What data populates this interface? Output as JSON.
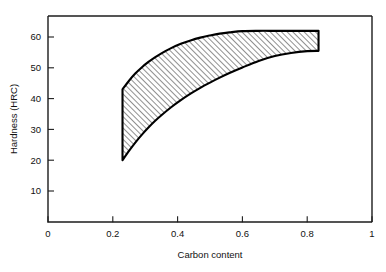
{
  "chart_data": {
    "type": "area",
    "title": "",
    "subtitle": "",
    "xlabel": "Carbon content",
    "ylabel": "Hardness (HRC)",
    "xlim": [
      0,
      1
    ],
    "ylim": [
      0,
      67
    ],
    "grid": false,
    "legend": null,
    "x_ticks": [
      "0",
      "0.2",
      "0.4",
      "0.6",
      "0.8",
      "1"
    ],
    "x_tick_values": [
      0,
      0.2,
      0.4,
      0.6,
      0.8,
      1
    ],
    "y_ticks": [
      "10",
      "20",
      "30",
      "40",
      "50",
      "60"
    ],
    "y_tick_values": [
      10,
      20,
      30,
      40,
      50,
      60
    ],
    "band": {
      "name": "Hardness range of fully hardened steel",
      "fill": "diagonal-hatch",
      "x": [
        0.23,
        0.25,
        0.27,
        0.29,
        0.31,
        0.33,
        0.35,
        0.38,
        0.41,
        0.44,
        0.47,
        0.5,
        0.53,
        0.56,
        0.6,
        0.65,
        0.7,
        0.75,
        0.8,
        0.835
      ],
      "upper": [
        43.0,
        45.8,
        48.2,
        50.2,
        51.9,
        53.4,
        54.7,
        56.4,
        57.8,
        58.9,
        59.8,
        60.5,
        61.1,
        61.5,
        61.9,
        62.0,
        62.0,
        62.0,
        62.0,
        62.0
      ],
      "lower": [
        20.0,
        23.0,
        25.8,
        28.3,
        30.6,
        32.7,
        34.6,
        37.2,
        39.5,
        41.6,
        43.5,
        45.2,
        46.8,
        48.3,
        50.1,
        52.2,
        53.8,
        54.8,
        55.4,
        55.5
      ]
    },
    "colors": {
      "axis": "#1c1c1c",
      "outline": "#000000",
      "hatch": "#2b2b2b",
      "background": "#ffffff"
    }
  },
  "figure": {
    "x_axis_title": "Carbon content",
    "y_axis_title": "Hardness (HRC)"
  }
}
